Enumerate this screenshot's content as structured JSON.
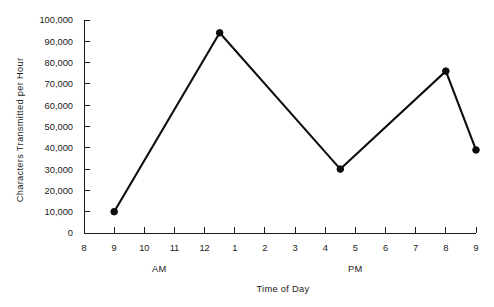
{
  "chart_data": {
    "type": "line",
    "title": "",
    "xlabel": "Time of Day",
    "ylabel": "Characters Transmitted per Hour",
    "x": [
      9,
      12.5,
      16.5,
      20,
      21
    ],
    "values": [
      10000,
      94000,
      30000,
      76000,
      39000
    ],
    "point_labels": [
      "9 AM",
      "12:30 PM",
      "4:30 PM",
      "8 PM",
      "9 PM"
    ],
    "xlim": [
      8,
      21
    ],
    "ylim": [
      0,
      100000
    ],
    "grid": false,
    "legend": null,
    "markers": true,
    "xtick_labels": [
      "8",
      "9",
      "10",
      "11",
      "12",
      "1",
      "2",
      "3",
      "4",
      "5",
      "6",
      "7",
      "8",
      "9"
    ],
    "xtick_values": [
      8,
      9,
      10,
      11,
      12,
      13,
      14,
      15,
      16,
      17,
      18,
      19,
      20,
      21
    ],
    "ytick_labels": [
      "0",
      "10,000",
      "20,000",
      "30,000",
      "40,000",
      "50,000",
      "60,000",
      "70,000",
      "80,000",
      "90,000",
      "100,000"
    ],
    "ytick_values": [
      0,
      10000,
      20000,
      30000,
      40000,
      50000,
      60000,
      70000,
      80000,
      90000,
      100000
    ],
    "annotations": [
      {
        "text": "AM",
        "x": 10.5
      },
      {
        "text": "PM",
        "x": 17
      }
    ],
    "line_color": "#0d0d0d",
    "axis_color": "#1a1a1a",
    "background_color": "#ffffff"
  }
}
